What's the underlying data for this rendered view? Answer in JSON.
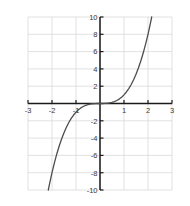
{
  "chart_data": {
    "type": "line",
    "title": "",
    "subtitle": "",
    "xlabel": "",
    "ylabel": "",
    "function": "y = x^3",
    "xlim": [
      -3,
      3
    ],
    "ylim": [
      -10,
      10
    ],
    "grid": true,
    "legend": null,
    "legend_position": "none",
    "x_ticks": [
      -3,
      -2,
      -1,
      1,
      2,
      3
    ],
    "y_ticks": [
      10,
      8,
      6,
      4,
      2,
      -2,
      -4,
      -6,
      -8,
      -10
    ],
    "x_tick_labels": [
      "-3",
      "-2",
      "-1",
      "1",
      "2",
      "3"
    ],
    "y_tick_labels": [
      "10",
      "8",
      "6",
      "4",
      "2",
      "-2",
      "-4",
      "-6",
      "-8",
      "-10"
    ],
    "x_gridlines": [
      -3,
      -2,
      -1,
      0,
      1,
      2,
      3
    ],
    "y_gridlines": [
      -10,
      -8,
      -6,
      -4,
      -2,
      0,
      2,
      4,
      6,
      8,
      10
    ],
    "curve_color": "#4d4d4d",
    "axis_color": "#1a1a1a",
    "grid_color": "#d9d9d9",
    "background_color": "#ffffff",
    "series": [
      {
        "name": "y = x^3",
        "x": [
          -2.154,
          -2.1,
          -2.0,
          -1.9,
          -1.8,
          -1.7,
          -1.6,
          -1.5,
          -1.4,
          -1.3,
          -1.2,
          -1.1,
          -1.0,
          -0.9,
          -0.8,
          -0.7,
          -0.6,
          -0.5,
          -0.4,
          -0.3,
          -0.2,
          -0.1,
          0.0,
          0.1,
          0.2,
          0.3,
          0.4,
          0.5,
          0.6,
          0.7,
          0.8,
          0.9,
          1.0,
          1.1,
          1.2,
          1.3,
          1.4,
          1.5,
          1.6,
          1.7,
          1.8,
          1.9,
          2.0,
          2.1,
          2.154
        ],
        "y": [
          -10.0,
          -9.261,
          -8.0,
          -6.859,
          -5.832,
          -4.913,
          -4.096,
          -3.375,
          -2.744,
          -2.197,
          -1.728,
          -1.331,
          -1.0,
          -0.729,
          -0.512,
          -0.343,
          -0.216,
          -0.125,
          -0.064,
          -0.027,
          -0.008,
          -0.001,
          0.0,
          0.001,
          0.008,
          0.027,
          0.064,
          0.125,
          0.216,
          0.343,
          0.512,
          0.729,
          1.0,
          1.331,
          1.728,
          2.197,
          2.744,
          3.375,
          4.096,
          4.913,
          5.832,
          6.859,
          8.0,
          9.261,
          10.0
        ]
      }
    ]
  }
}
